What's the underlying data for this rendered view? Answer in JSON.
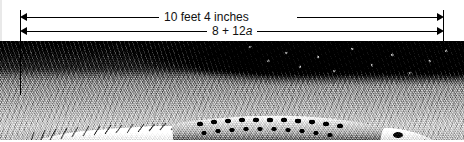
{
  "figure": {
    "width": 464,
    "height": 142,
    "background_color": "#ffffff",
    "line_color": "#000000"
  },
  "dimensions": [
    {
      "name": "measurement-length",
      "label": "10 feet 4 inches",
      "arrow_style": "double-headed",
      "row": 1
    },
    {
      "name": "expression-length",
      "label_prefix": "8 + 12",
      "label_variable": "a",
      "label_full": "8 + 12a",
      "arrow_style": "double-headed",
      "row": 2
    }
  ],
  "photo": {
    "alt_name": "alligator-photograph",
    "subject": "alligator",
    "orientation": "head-facing-right",
    "rendering": "black-and-white halftone"
  },
  "extents": {
    "left_tick_name": "left-extent-tick",
    "right_tick_name": "right-extent-tick"
  }
}
